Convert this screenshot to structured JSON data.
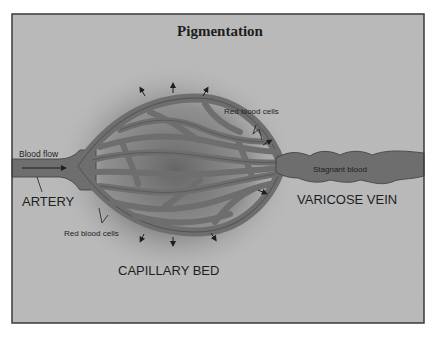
{
  "figure": {
    "title": "Pigmentation",
    "labels": {
      "blood_flow": "Blood flow",
      "artery": "ARTERY",
      "red_blood_cells_top": "Red blood cells",
      "red_blood_cells_bottom": "Red blood cells",
      "stagnant_blood": "Stagnant blood",
      "varicose_vein": "VARICOSE VEIN",
      "capillary_bed": "CAPILLARY BED"
    },
    "colors": {
      "background": "#b9b9b9",
      "frame": "#3a3a3a",
      "vessel": "#6e6e6e",
      "vessel_outline": "#3c3c3c",
      "pigment_halo": "#5a5a5a",
      "text": "#1e1e1e"
    }
  }
}
